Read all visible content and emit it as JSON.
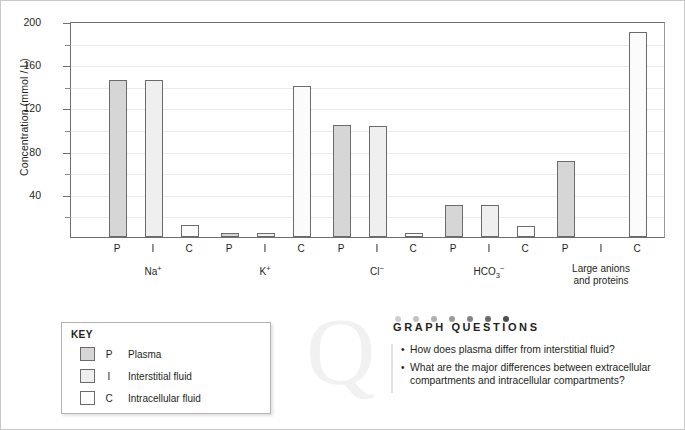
{
  "chart_data": {
    "type": "bar",
    "title": "",
    "xlabel": "",
    "ylabel": "Concentration (mmol / L)",
    "ylim": [
      0,
      200
    ],
    "ytick_labels": [
      "40",
      "80",
      "120",
      "160",
      "200"
    ],
    "ytick_values": [
      40,
      80,
      120,
      160,
      200
    ],
    "minor_tick_values": [
      20,
      60,
      100,
      140,
      180
    ],
    "grid": true,
    "legend_position": "below-left",
    "categories": [
      "Na⁺",
      "K⁺",
      "Cl⁻",
      "HCO₃⁻",
      "Large anions and proteins"
    ],
    "subcategories": [
      "P",
      "I",
      "C"
    ],
    "series": [
      {
        "name": "P",
        "label": "Plasma",
        "values": [
          145,
          4,
          104,
          30,
          70
        ]
      },
      {
        "name": "I",
        "label": "Interstitial fluid",
        "values": [
          145,
          4,
          103,
          30,
          0
        ]
      },
      {
        "name": "C",
        "label": "Intracellular fluid",
        "values": [
          11,
          140,
          4,
          10,
          190
        ]
      }
    ]
  },
  "axis": {
    "y_title": "Concentration (mmol / L)"
  },
  "groups": [
    {
      "id": "sodium",
      "label_html": "Na<sup>+</sup>",
      "label": "Na+"
    },
    {
      "id": "potassium",
      "label_html": "K<sup>+</sup>",
      "label": "K+"
    },
    {
      "id": "chloride",
      "label_html": "Cl<sup>−</sup>",
      "label": "Cl−"
    },
    {
      "id": "bicarbonate",
      "label_html": "HCO<sub>3</sub><sup>−</sup>",
      "label": "HCO3−"
    },
    {
      "id": "large-anions",
      "label_html": "Large anions<br>and proteins",
      "label": "Large anions and proteins"
    }
  ],
  "key": {
    "title": "KEY",
    "rows": [
      {
        "code": "P",
        "label": "Plasma"
      },
      {
        "code": "I",
        "label": "Interstitial fluid"
      },
      {
        "code": "C",
        "label": "Intracellular fluid"
      }
    ]
  },
  "questions": {
    "watermark": "Q",
    "title": "GRAPH QUESTIONS",
    "dot_colors": [
      "#cfcfcf",
      "#c2c2c2",
      "#b0b0b0",
      "#9b9b9b",
      "#828282",
      "#6a6a6a",
      "#4d4d4d"
    ],
    "items": [
      "How does plasma differ from interstitial fluid?",
      "What are the major differences between extracellular compartments and intracellular compartments?"
    ]
  },
  "colors": {
    "bar_plasma": "#d6d6d6",
    "bar_interstitial": "#efefef",
    "bar_intracellular": "#fbfbfb",
    "bar_border": "#6b6b6b",
    "gridline": "#ebebeb",
    "axis": "#6e6e6e",
    "text": "#231f20",
    "page_border": "#c9c9c9"
  }
}
